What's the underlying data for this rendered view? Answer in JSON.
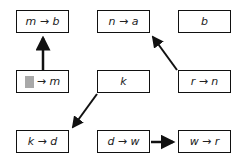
{
  "diagram": {
    "boxes": [
      {
        "id": "b00",
        "row": 0,
        "col": 0,
        "label": "m → b"
      },
      {
        "id": "b01",
        "row": 0,
        "col": 1,
        "label": "n → a"
      },
      {
        "id": "b02",
        "row": 0,
        "col": 2,
        "label": "b"
      },
      {
        "id": "b10",
        "row": 1,
        "col": 0,
        "label": "→ m",
        "has_blank": true
      },
      {
        "id": "b11",
        "row": 1,
        "col": 1,
        "label": "k"
      },
      {
        "id": "b12",
        "row": 1,
        "col": 2,
        "label": "r → n"
      },
      {
        "id": "b20",
        "row": 2,
        "col": 0,
        "label": "k → d"
      },
      {
        "id": "b21",
        "row": 2,
        "col": 1,
        "label": "d → w"
      },
      {
        "id": "b22",
        "row": 2,
        "col": 2,
        "label": "w → r"
      }
    ],
    "arrows": [
      {
        "from": "b10",
        "to": "b00"
      },
      {
        "from": "b12",
        "to": "b01"
      },
      {
        "from": "b11",
        "to": "b20"
      },
      {
        "from": "b21",
        "to": "b22"
      }
    ],
    "colors": {
      "stroke": "#111111",
      "blank": "#a9a9a9",
      "background": "#ffffff"
    }
  }
}
